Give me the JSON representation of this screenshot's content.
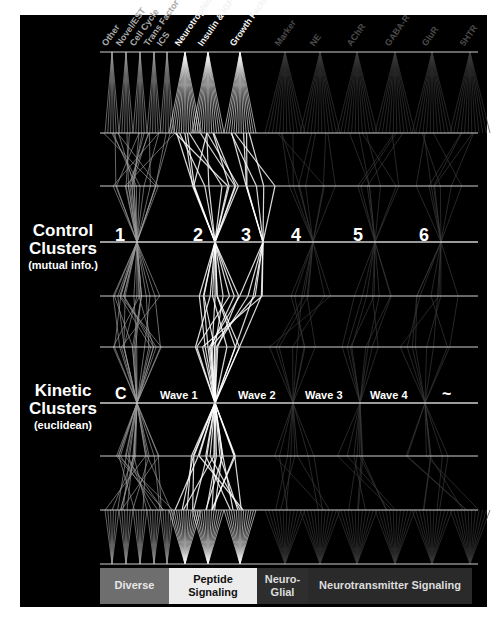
{
  "figure": {
    "rows": {
      "control": {
        "title": "Control",
        "title2": "Clusters",
        "subtitle": "(mutual info.)"
      },
      "kinetic": {
        "title": "Kinetic",
        "title2": "Clusters",
        "subtitle": "(euclidean)"
      }
    },
    "gene_classes": [
      {
        "label": "Other",
        "x": 112,
        "color": "#9a9a9a"
      },
      {
        "label": "Novel/EST",
        "x": 126,
        "color": "#9a9a9a"
      },
      {
        "label": "Cell Cycle",
        "x": 140,
        "color": "#9a9a9a"
      },
      {
        "label": "Trans Factor",
        "x": 154,
        "color": "#9a9a9a"
      },
      {
        "label": "ICS",
        "x": 167,
        "color": "#9a9a9a"
      },
      {
        "label": "Neurotrophin",
        "x": 185,
        "color": "#f0f0f0"
      },
      {
        "label": "Insulin & IGF",
        "x": 208,
        "color": "#f0f0f0"
      },
      {
        "label": "Growth Factor",
        "x": 240,
        "color": "#f0f0f0"
      },
      {
        "label": "Marker",
        "x": 285,
        "color": "#3a3a3a"
      },
      {
        "label": "NE",
        "x": 320,
        "color": "#3a3a3a"
      },
      {
        "label": "AChR",
        "x": 357,
        "color": "#3a3a3a"
      },
      {
        "label": "GABA-R",
        "x": 395,
        "color": "#3a3a3a"
      },
      {
        "label": "GluR",
        "x": 432,
        "color": "#3a3a3a"
      },
      {
        "label": "5HTR",
        "x": 470,
        "color": "#3a3a3a"
      }
    ],
    "control_clusters": [
      {
        "label": "1",
        "x": 137
      },
      {
        "label": "2",
        "x": 215
      },
      {
        "label": "3",
        "x": 263
      },
      {
        "label": "4",
        "x": 313
      },
      {
        "label": "5",
        "x": 375
      },
      {
        "label": "6",
        "x": 441
      }
    ],
    "kinetic_clusters": [
      {
        "label": "C",
        "x": 137
      },
      {
        "label": "Wave 1",
        "x": 215
      },
      {
        "label": "Wave 2",
        "x": 293
      },
      {
        "label": "Wave 3",
        "x": 360
      },
      {
        "label": "Wave 4",
        "x": 425
      },
      {
        "label": "~",
        "x": 464
      }
    ],
    "bottom_bands": [
      {
        "label": "Diverse",
        "x": 100,
        "w": 69,
        "bg": "#6e6e6e",
        "fg": "#e8e8e8"
      },
      {
        "label": "Peptide Signaling",
        "x": 169,
        "w": 88,
        "bg": "#ececec",
        "fg": "#111111"
      },
      {
        "label": "Neuro- Glial",
        "x": 257,
        "w": 51,
        "bg": "#2e2e2e",
        "fg": "#dddddd"
      },
      {
        "label": "Neurotransmitter Signaling",
        "x": 308,
        "w": 164,
        "bg": "#2a2a2a",
        "fg": "#dddddd"
      }
    ]
  }
}
